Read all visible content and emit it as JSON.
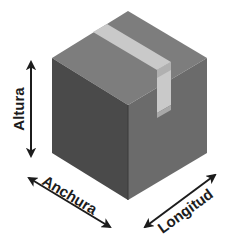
{
  "figure": {
    "type": "isometric-box-diagram",
    "background_color": "#ffffff",
    "box": {
      "name": "cardboard-box",
      "left_face_color": "#4a4a4a",
      "right_face_color": "#6b6b6b",
      "top_face_color": "#7d7d7d",
      "tape_color": "#c9c9c9",
      "tape_shadow_color": "#b0b0b0"
    },
    "labels": {
      "height": "Altura",
      "width": "Anchura",
      "length": "Longitud"
    },
    "arrow_color": "#1c1c1c",
    "caption_fragment": ""
  }
}
